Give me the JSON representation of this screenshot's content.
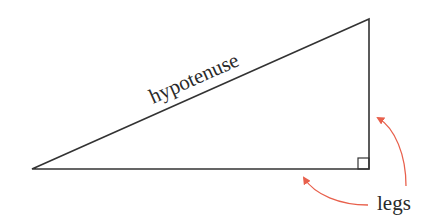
{
  "diagram": {
    "type": "right-triangle",
    "labels": {
      "hypotenuse": "hypotenuse",
      "legs": "legs"
    },
    "vertices": {
      "left": [
        32,
        169
      ],
      "right_angle": [
        369,
        169
      ],
      "top": [
        369,
        19
      ]
    },
    "right_angle_marker": {
      "x": 358,
      "y": 158,
      "size": 11
    },
    "colors": {
      "stroke": "#333333",
      "arrow": "#e8604c",
      "text": "#2a2a2a"
    },
    "arrows": [
      {
        "name": "arrow-to-bottom-leg",
        "from": [
          368,
          205
        ],
        "to": [
          303,
          176
        ]
      },
      {
        "name": "arrow-to-vertical-leg",
        "from": [
          406,
          186
        ],
        "to": [
          376,
          117
        ]
      }
    ]
  }
}
